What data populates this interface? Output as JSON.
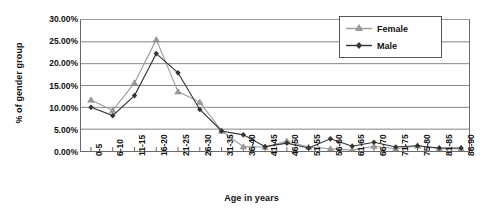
{
  "chart_data": {
    "type": "line",
    "title": "",
    "xlabel": "Age in years",
    "ylabel": "% of gender group",
    "ylim": [
      0,
      30
    ],
    "ytick_step": 5,
    "ytick_labels": [
      "0.00%",
      "5.00%",
      "10.00%",
      "15.00%",
      "20.00%",
      "25.00%",
      "30.00%"
    ],
    "ytick_values": [
      0,
      5,
      10,
      15,
      20,
      25,
      30
    ],
    "grid": "horizontal",
    "legend_position": "top-right",
    "categories": [
      "0-5",
      "6-10",
      "11-15",
      "16-20",
      "21-25",
      "26-30",
      "31-35",
      "36-40",
      "41-45",
      "46-50",
      "51-55",
      "56-60",
      "61-65",
      "66-70",
      "71-75",
      "75-80",
      "81-85",
      "86-90"
    ],
    "series": [
      {
        "name": "Female",
        "marker": "triangle",
        "color": "#9a9a9a",
        "values": [
          11.7,
          9.3,
          15.6,
          25.5,
          13.6,
          11.2,
          4.6,
          1.0,
          0.9,
          2.3,
          0.9,
          0.5,
          0.2,
          1.1,
          0.5,
          1.2,
          0.5,
          0.5
        ]
      },
      {
        "name": "Male",
        "marker": "diamond",
        "color": "#333333",
        "values": [
          10.0,
          8.1,
          12.7,
          22.3,
          17.9,
          9.5,
          4.6,
          3.7,
          1.0,
          1.8,
          0.7,
          2.8,
          1.1,
          2.0,
          0.9,
          1.2,
          0.7,
          0.7
        ]
      }
    ]
  },
  "legend": {
    "items": [
      {
        "label": "Female"
      },
      {
        "label": "Male"
      }
    ]
  }
}
